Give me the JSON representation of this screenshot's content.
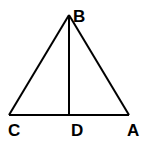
{
  "diagram": {
    "type": "triangle with altitude",
    "points": {
      "B": {
        "label": "B",
        "x": 69,
        "y": 15
      },
      "C": {
        "label": "C",
        "x": 9,
        "y": 115
      },
      "D": {
        "label": "D",
        "x": 70,
        "y": 115
      },
      "A": {
        "label": "A",
        "x": 129,
        "y": 115
      }
    },
    "segments": [
      "BC",
      "BA",
      "CA",
      "BD"
    ],
    "stroke_color": "#000000"
  }
}
